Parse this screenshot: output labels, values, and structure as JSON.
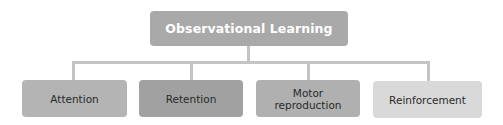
{
  "diagram": {
    "type": "hierarchy",
    "root": {
      "label": "Observational Learning",
      "color": "#a9a9a9"
    },
    "children": [
      {
        "label": "Attention",
        "color": "#b4b4b4"
      },
      {
        "label": "Retention",
        "color": "#a1a1a1"
      },
      {
        "label": "Motor reproduction",
        "line1": "Motor",
        "line2": "reproduction",
        "color": "#b0b0b0"
      },
      {
        "label": "Reinforcement",
        "color": "#d9d9d9"
      }
    ],
    "connector_color": "#c4c4c4"
  }
}
